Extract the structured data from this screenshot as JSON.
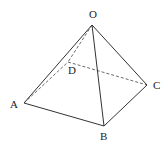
{
  "diagram": {
    "type": "square pyramid",
    "vertices": {
      "O": {
        "label": "O",
        "x": 92,
        "y": 25,
        "lx": 93,
        "ly": 18
      },
      "A": {
        "label": "A",
        "x": 24,
        "y": 103,
        "lx": 14,
        "ly": 108
      },
      "B": {
        "label": "B",
        "x": 104,
        "y": 126,
        "lx": 104,
        "ly": 140
      },
      "C": {
        "label": "C",
        "x": 147,
        "y": 85,
        "lx": 157,
        "ly": 89
      },
      "D": {
        "label": "D",
        "x": 68,
        "y": 62,
        "lx": 72,
        "ly": 74
      }
    },
    "visible_edges": [
      [
        "O",
        "A"
      ],
      [
        "O",
        "B"
      ],
      [
        "O",
        "C"
      ],
      [
        "A",
        "B"
      ],
      [
        "B",
        "C"
      ]
    ],
    "hidden_edges": [
      [
        "O",
        "D"
      ],
      [
        "A",
        "D"
      ],
      [
        "D",
        "C"
      ]
    ]
  }
}
